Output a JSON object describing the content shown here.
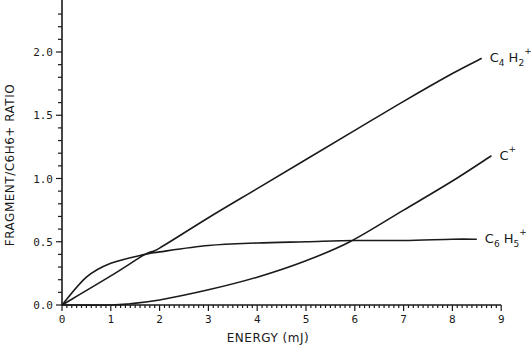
{
  "chart_data": {
    "type": "line",
    "title": "",
    "xlabel": "ENERGY (mJ)",
    "ylabel": "FRAGMENT/C6H6+ RATIO",
    "xlim": [
      0,
      9
    ],
    "ylim": [
      0,
      2.35
    ],
    "x_ticks": [
      "0",
      "1",
      "2",
      "3",
      "4",
      "5",
      "6",
      "7",
      "8",
      "9"
    ],
    "y_ticks": [
      "0.0",
      "0.5",
      "1.0",
      "1.5",
      "2.0"
    ],
    "grid": false,
    "legend": "inline labels at curve ends (right)",
    "series": [
      {
        "name": "C4H2+",
        "label_base": "C",
        "label_sub1": "4",
        "label_mid": "H",
        "label_sub2": "2",
        "label_sup": "+",
        "x": [
          0,
          1,
          1.7,
          2,
          3,
          4,
          5,
          6,
          7,
          8,
          8.6
        ],
        "y": [
          0,
          0.23,
          0.4,
          0.45,
          0.69,
          0.92,
          1.15,
          1.38,
          1.61,
          1.83,
          1.95
        ]
      },
      {
        "name": "C+",
        "label_base": "C",
        "label_sup": "+",
        "x": [
          0,
          1,
          1.4,
          2,
          3,
          4,
          5,
          5.9,
          7,
          8,
          8.8
        ],
        "y": [
          0,
          0,
          0.01,
          0.04,
          0.12,
          0.22,
          0.35,
          0.5,
          0.75,
          0.98,
          1.18
        ]
      },
      {
        "name": "C6H5+",
        "label_base": "C",
        "label_sub1": "6",
        "label_mid": "H",
        "label_sub2": "5",
        "label_sup": "+",
        "x": [
          0,
          0.5,
          1,
          1.7,
          2,
          3,
          4,
          5,
          6,
          7,
          8,
          8.5
        ],
        "y": [
          0,
          0.22,
          0.33,
          0.4,
          0.42,
          0.47,
          0.49,
          0.5,
          0.51,
          0.51,
          0.52,
          0.52
        ]
      }
    ]
  }
}
